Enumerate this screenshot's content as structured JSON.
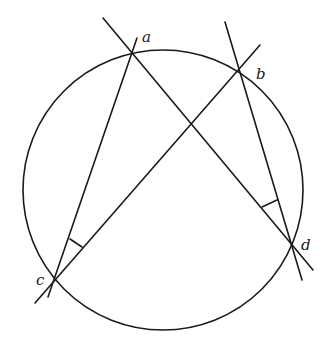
{
  "diagram": {
    "circle": {
      "cx": 163,
      "cy": 190,
      "r": 140
    },
    "points": {
      "a": {
        "label": "a",
        "x": 132,
        "y": 52,
        "label_x": 142,
        "label_y": 42
      },
      "b": {
        "label": "b",
        "x": 238,
        "y": 71,
        "label_x": 256,
        "label_y": 79
      },
      "c": {
        "label": "c",
        "x": 54,
        "y": 280,
        "label_x": 36,
        "label_y": 285
      },
      "d": {
        "label": "d",
        "x": 293,
        "y": 245,
        "label_x": 301,
        "label_y": 250
      }
    },
    "lines": [
      {
        "name": "line-ad",
        "x1": 103,
        "y1": 18,
        "x2": 313,
        "y2": 270
      },
      {
        "name": "line-ac",
        "x1": 137,
        "y1": 38,
        "x2": 48,
        "y2": 297
      },
      {
        "name": "line-bc",
        "x1": 260,
        "y1": 45,
        "x2": 35,
        "y2": 303
      },
      {
        "name": "line-bd",
        "x1": 225,
        "y1": 22,
        "x2": 302,
        "y2": 280
      }
    ],
    "angle_marks": [
      {
        "name": "angle-acb-mark",
        "vertex": "c",
        "points": "70,239 82,247"
      },
      {
        "name": "angle-adb-mark",
        "vertex": "d",
        "points": "262,207 277,200"
      }
    ]
  }
}
